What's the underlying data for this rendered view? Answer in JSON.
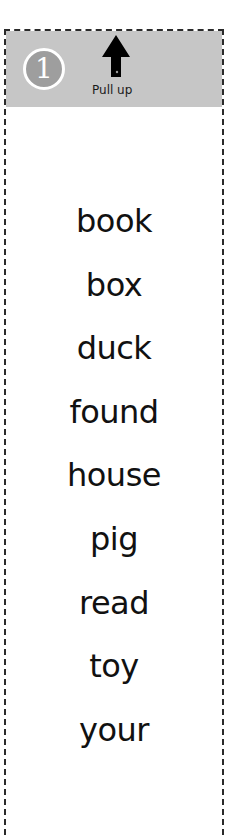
{
  "card": {
    "step_number": "1",
    "instruction": "Pull up",
    "icon": "arrow-up-icon",
    "colors": {
      "header_bg": "#c6c6c6",
      "badge_bg": "#9e9e9e",
      "badge_ring": "#ffffff",
      "border": "#2a2a2a",
      "text": "#111111"
    }
  },
  "words": [
    "book",
    "box",
    "duck",
    "found",
    "house",
    "pig",
    "read",
    "toy",
    "your"
  ]
}
